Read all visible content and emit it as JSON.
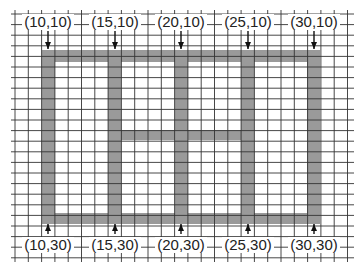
{
  "diagram": {
    "type": "grid-structure",
    "colors": {
      "background": "#ffffff",
      "grid_line": "#333333",
      "beam_fill": "#9a9a9a",
      "text": "#222222",
      "arrow": "#111111"
    },
    "grid": {
      "x_start": 15,
      "x_end": 350,
      "x_step": 13.3,
      "y_start": 14,
      "y_end": 258,
      "y_step": 10.6
    },
    "beams": {
      "top": {
        "x1": 42,
        "x2": 320,
        "y1": 50,
        "y2": 62
      },
      "bottom": {
        "x1": 42,
        "x2": 320,
        "y1": 213,
        "y2": 224
      },
      "middle": {
        "x1": 121,
        "x2": 241,
        "y1": 130,
        "y2": 140
      },
      "columns": [
        {
          "x1": 42,
          "x2": 55
        },
        {
          "x1": 108,
          "x2": 121
        },
        {
          "x1": 175,
          "x2": 188
        },
        {
          "x1": 241,
          "x2": 254
        },
        {
          "x1": 307,
          "x2": 320
        }
      ]
    },
    "top_labels": [
      {
        "text": "(10,10)",
        "x": 48
      },
      {
        "text": "(15,10)",
        "x": 115
      },
      {
        "text": "(20,10)",
        "x": 181
      },
      {
        "text": "(25,10)",
        "x": 248
      },
      {
        "text": "(30,10)",
        "x": 314
      }
    ],
    "bottom_labels": [
      {
        "text": "(10,30)",
        "x": 48
      },
      {
        "text": "(15,30)",
        "x": 115
      },
      {
        "text": "(20,30)",
        "x": 181
      },
      {
        "text": "(25,30)",
        "x": 248
      },
      {
        "text": "(30,30)",
        "x": 314
      }
    ]
  }
}
